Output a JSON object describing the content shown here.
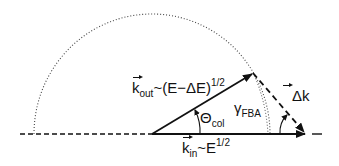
{
  "figure": {
    "labels": {
      "k_out": {
        "symbol": "k",
        "subscript": "out",
        "relation": "~(E−ΔE)",
        "exponent": "1/2"
      },
      "k_in": {
        "symbol": "k",
        "subscript": "in",
        "relation": "~E",
        "exponent": "1/2"
      },
      "theta": {
        "symbol": "Θ",
        "subscript": "col"
      },
      "gamma": {
        "symbol": "γ",
        "subscript": "FBA"
      },
      "delta_k": {
        "symbol": "Δk"
      }
    },
    "colors": {
      "stroke": "#111111",
      "background": "#ffffff"
    }
  }
}
